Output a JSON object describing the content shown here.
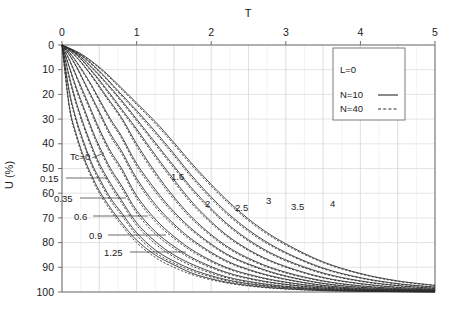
{
  "chart_data": {
    "type": "line",
    "title": "",
    "xlabel": "T",
    "ylabel": "U (%)",
    "xlim": [
      0,
      5
    ],
    "ylim": [
      0,
      100
    ],
    "y_inverted": true,
    "xticks": [
      "0",
      "1",
      "2",
      "3",
      "4",
      "5"
    ],
    "xtick_values": [
      0,
      1,
      2,
      3,
      4,
      5
    ],
    "yticks": [
      "0",
      "10",
      "20",
      "30",
      "40",
      "50",
      "60",
      "70",
      "80",
      "90",
      "100"
    ],
    "ytick_values": [
      0,
      10,
      20,
      30,
      40,
      50,
      60,
      70,
      80,
      90,
      100
    ],
    "x_axis_position": "top",
    "grid": true,
    "grid_minor_step_x": 0.25,
    "grid_major_step_x": 0.5,
    "grid_major_step_y": 10,
    "legend": {
      "position": "top-right",
      "parameter": "L=0",
      "entries": [
        {
          "label": "N=10",
          "style": "solid"
        },
        {
          "label": "N=40",
          "style": "dashed"
        }
      ]
    },
    "curve_parameter_name": "Tc",
    "series": [
      {
        "name": "Tc=0",
        "tc": 0,
        "label": "Tc=0",
        "label_x": 70,
        "label_y": 160,
        "leader_x1": 92,
        "leader_y1": 158,
        "leader_x2": 104,
        "leader_y2": 153,
        "x": [
          0,
          0.1,
          0.2,
          0.3,
          0.4,
          0.5,
          0.65,
          0.8,
          1.0,
          1.25,
          1.5,
          1.8,
          2.2,
          2.6,
          3.0,
          3.5,
          4.0,
          4.5,
          5.0
        ],
        "u_n10": [
          0,
          25,
          37,
          46,
          53,
          59,
          66,
          72,
          79,
          85,
          89,
          93,
          96,
          97.7,
          98.7,
          99.4,
          99.7,
          99.85,
          99.95
        ],
        "u_n40": [
          0,
          26,
          38,
          47,
          54,
          60,
          67,
          73,
          80,
          86,
          90,
          93.5,
          96.3,
          97.9,
          98.8,
          99.45,
          99.72,
          99.87,
          99.96
        ]
      },
      {
        "name": "Tc=0.15",
        "tc": 0.15,
        "label": "0.15",
        "label_x": 40,
        "label_y": 182,
        "leader_x1": 66,
        "leader_y1": 178,
        "leader_x2": 108,
        "leader_y2": 178,
        "x": [
          0,
          0.1,
          0.2,
          0.3,
          0.4,
          0.5,
          0.65,
          0.8,
          1.0,
          1.25,
          1.5,
          1.8,
          2.2,
          2.6,
          3.0,
          3.5,
          4.0,
          4.5,
          5.0
        ],
        "u_n10": [
          0,
          19,
          31,
          40,
          48,
          54,
          62,
          68,
          76,
          83,
          87.5,
          91.5,
          95,
          97,
          98.2,
          99.1,
          99.55,
          99.78,
          99.9
        ],
        "u_n40": [
          0,
          20,
          32,
          41,
          49,
          55,
          63,
          69,
          77,
          84,
          88.3,
          92.1,
          95.4,
          97.3,
          98.4,
          99.2,
          99.6,
          99.82,
          99.92
        ]
      },
      {
        "name": "Tc=0.35",
        "tc": 0.35,
        "label": "0.35",
        "label_x": 54,
        "label_y": 202,
        "leader_x1": 80,
        "leader_y1": 198,
        "leader_x2": 126,
        "leader_y2": 198,
        "x": [
          0,
          0.1,
          0.2,
          0.3,
          0.4,
          0.5,
          0.65,
          0.8,
          1.0,
          1.25,
          1.5,
          1.8,
          2.2,
          2.6,
          3.0,
          3.5,
          4.0,
          4.5,
          5.0
        ],
        "u_n10": [
          0,
          13,
          24,
          33,
          41,
          48,
          56,
          63,
          72,
          79.5,
          85,
          89.5,
          93.8,
          96.2,
          97.7,
          98.8,
          99.4,
          99.7,
          99.85
        ],
        "u_n40": [
          0,
          14,
          25,
          34,
          42,
          49,
          57,
          64,
          73,
          80.5,
          85.8,
          90.2,
          94.2,
          96.5,
          97.9,
          98.9,
          99.45,
          99.73,
          99.87
        ]
      },
      {
        "name": "Tc=0.6",
        "tc": 0.6,
        "label": "0.6",
        "label_x": 74,
        "label_y": 220,
        "leader_x1": 93,
        "leader_y1": 216,
        "leader_x2": 148,
        "leader_y2": 216,
        "x": [
          0,
          0.1,
          0.2,
          0.3,
          0.4,
          0.5,
          0.65,
          0.8,
          1.0,
          1.25,
          1.5,
          1.8,
          2.2,
          2.6,
          3.0,
          3.5,
          4.0,
          4.5,
          5.0
        ],
        "u_n10": [
          0,
          9,
          18,
          26,
          34,
          41,
          50,
          57,
          67,
          75.5,
          81.5,
          87,
          92,
          95,
          96.9,
          98.4,
          99.2,
          99.55,
          99.76
        ],
        "u_n40": [
          0,
          9.5,
          19,
          27,
          35,
          42,
          51,
          58,
          68,
          76.5,
          82.3,
          87.6,
          92.4,
          95.3,
          97.1,
          98.5,
          99.26,
          99.6,
          99.79
        ]
      },
      {
        "name": "Tc=0.9",
        "tc": 0.9,
        "label": "0.9",
        "label_x": 89,
        "label_y": 239,
        "leader_x1": 108,
        "leader_y1": 235,
        "leader_x2": 166,
        "leader_y2": 235,
        "x": [
          0,
          0.1,
          0.2,
          0.3,
          0.4,
          0.5,
          0.65,
          0.8,
          1.0,
          1.25,
          1.5,
          1.8,
          2.2,
          2.6,
          3.0,
          3.5,
          4.0,
          4.5,
          5.0
        ],
        "u_n10": [
          0,
          6,
          13,
          20,
          27,
          34,
          43,
          50,
          61,
          70.5,
          77.5,
          84,
          90,
          93.6,
          96,
          97.9,
          98.9,
          99.4,
          99.68
        ],
        "u_n40": [
          0,
          6.3,
          13.6,
          21,
          28,
          35,
          44,
          51,
          62,
          71.5,
          78.3,
          84.6,
          90.4,
          93.9,
          96.2,
          98,
          98.96,
          99.44,
          99.71
        ]
      },
      {
        "name": "Tc=1.25",
        "tc": 1.25,
        "label": "1.25",
        "label_x": 104,
        "label_y": 256,
        "leader_x1": 130,
        "leader_y1": 252,
        "leader_x2": 186,
        "leader_y2": 252,
        "x": [
          0,
          0.1,
          0.2,
          0.3,
          0.4,
          0.5,
          0.65,
          0.8,
          1.0,
          1.25,
          1.5,
          1.8,
          2.2,
          2.6,
          3.0,
          3.5,
          4.0,
          4.5,
          5.0
        ],
        "u_n10": [
          0,
          4,
          9,
          15,
          21,
          27,
          36,
          43,
          54,
          64.5,
          72.5,
          80,
          87.3,
          91.8,
          94.8,
          97.3,
          98.6,
          99.2,
          99.55
        ],
        "u_n40": [
          0,
          4.2,
          9.4,
          15.5,
          21.7,
          27.8,
          37,
          44,
          55,
          65.5,
          73.3,
          80.6,
          87.7,
          92.1,
          95,
          97.4,
          98.66,
          99.25,
          99.58
        ]
      },
      {
        "name": "Tc=1.6",
        "tc": 1.6,
        "label": "1.6",
        "label_x": 171,
        "label_y": 180,
        "leader_x1": null,
        "leader_y1": null,
        "leader_x2": null,
        "leader_y2": null,
        "x": [
          0,
          0.1,
          0.2,
          0.3,
          0.4,
          0.5,
          0.65,
          0.8,
          1.0,
          1.25,
          1.5,
          1.8,
          2.2,
          2.6,
          3.0,
          3.5,
          4.0,
          4.5,
          5.0
        ],
        "u_n10": [
          0,
          3,
          7,
          11.5,
          16.5,
          22,
          30,
          37,
          48,
          58.5,
          67.5,
          76,
          84.5,
          89.8,
          93.5,
          96.5,
          98.1,
          98.95,
          99.4
        ],
        "u_n40": [
          0,
          3.2,
          7.3,
          12,
          17,
          22.6,
          30.8,
          37.8,
          49,
          59.5,
          68.3,
          76.6,
          84.9,
          90.1,
          93.7,
          96.6,
          98.17,
          99,
          99.44
        ]
      },
      {
        "name": "Tc=2",
        "tc": 2,
        "label": "2",
        "label_x": 205,
        "label_y": 207,
        "leader_x1": null,
        "leader_y1": null,
        "leader_x2": null,
        "leader_y2": null,
        "x": [
          0,
          0.15,
          0.3,
          0.45,
          0.6,
          0.8,
          1.0,
          1.25,
          1.5,
          1.8,
          2.2,
          2.6,
          3.0,
          3.5,
          4.0,
          4.5,
          5.0
        ],
        "u_n10": [
          0,
          3.5,
          8.5,
          14.5,
          21,
          29.5,
          40,
          51.5,
          61.5,
          71.5,
          81.3,
          87.7,
          92,
          95.5,
          97.5,
          98.6,
          99.2
        ],
        "u_n40": [
          0,
          3.7,
          8.8,
          15,
          21.6,
          30.2,
          41,
          52.5,
          62.4,
          72.2,
          81.8,
          88.1,
          92.3,
          95.7,
          97.6,
          98.67,
          99.25
        ]
      },
      {
        "name": "Tc=2.5",
        "tc": 2.5,
        "label": "2.5",
        "label_x": 235,
        "label_y": 211,
        "leader_x1": null,
        "leader_y1": null,
        "leader_x2": null,
        "leader_y2": null,
        "x": [
          0,
          0.2,
          0.4,
          0.6,
          0.8,
          1.0,
          1.25,
          1.5,
          1.8,
          2.2,
          2.6,
          3.0,
          3.5,
          4.0,
          4.5,
          5.0
        ],
        "u_n10": [
          0,
          4,
          10.5,
          18,
          26,
          34,
          44.5,
          54.5,
          65.5,
          76.8,
          84.5,
          89.7,
          94.1,
          96.6,
          98.1,
          98.9
        ],
        "u_n40": [
          0,
          4.2,
          10.9,
          18.6,
          26.7,
          34.8,
          45.4,
          55.4,
          66.3,
          77.3,
          84.9,
          90,
          94.3,
          96.75,
          98.2,
          98.97
        ]
      },
      {
        "name": "Tc=3",
        "tc": 3,
        "label": "3",
        "label_x": 266,
        "label_y": 204,
        "leader_x1": null,
        "leader_y1": null,
        "leader_x2": null,
        "leader_y2": null,
        "x": [
          0,
          0.2,
          0.4,
          0.6,
          0.8,
          1.0,
          1.25,
          1.5,
          1.8,
          2.2,
          2.6,
          3.0,
          3.5,
          4.0,
          4.5,
          5.0
        ],
        "u_n10": [
          0,
          3.5,
          9,
          15.5,
          22.5,
          30,
          39.5,
          49,
          60,
          72,
          80.8,
          87,
          92.3,
          95.5,
          97.4,
          98.5
        ],
        "u_n40": [
          0,
          3.7,
          9.3,
          16,
          23.1,
          30.7,
          40.3,
          49.8,
          60.8,
          72.6,
          81.3,
          87.4,
          92.6,
          95.7,
          97.5,
          98.6
        ]
      },
      {
        "name": "Tc=3.5",
        "tc": 3.5,
        "label": "3.5",
        "label_x": 291,
        "label_y": 210,
        "leader_x1": null,
        "leader_y1": null,
        "leader_x2": null,
        "leader_y2": null,
        "x": [
          0,
          0.25,
          0.5,
          0.75,
          1.0,
          1.25,
          1.5,
          1.8,
          2.2,
          2.6,
          3.0,
          3.5,
          4.0,
          4.5,
          5.0
        ],
        "u_n10": [
          0,
          4,
          10.5,
          18.5,
          26.5,
          35,
          44,
          55,
          67.5,
          77,
          84,
          90.3,
          94.2,
          96.6,
          98
        ],
        "u_n40": [
          0,
          4.2,
          10.9,
          19,
          27.2,
          35.8,
          44.8,
          55.8,
          68.2,
          77.6,
          84.4,
          90.6,
          94.4,
          96.8,
          98.1
        ]
      },
      {
        "name": "Tc=4",
        "tc": 4,
        "label": "4",
        "label_x": 330,
        "label_y": 207,
        "leader_x1": null,
        "leader_y1": null,
        "leader_x2": null,
        "leader_y2": null,
        "x": [
          0,
          0.25,
          0.5,
          0.75,
          1.0,
          1.25,
          1.5,
          1.8,
          2.2,
          2.6,
          3.0,
          3.5,
          4.0,
          4.5,
          5.0
        ],
        "u_n10": [
          0,
          3.5,
          9,
          16,
          23.5,
          31,
          39.5,
          50,
          62.5,
          72.8,
          80.5,
          87.8,
          92.5,
          95.5,
          97.3
        ],
        "u_n40": [
          0,
          3.7,
          9.4,
          16.5,
          24.1,
          31.8,
          40.3,
          50.8,
          63.2,
          73.4,
          81,
          88.1,
          92.7,
          95.7,
          97.4
        ]
      }
    ]
  },
  "axes": {
    "x_title": "T",
    "y_title": "U (%)"
  }
}
